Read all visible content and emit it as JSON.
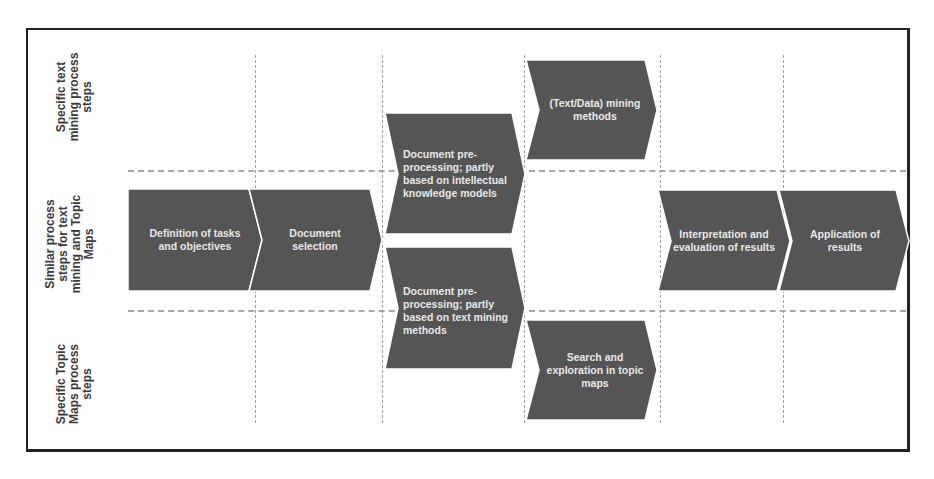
{
  "lanes": [
    {
      "id": "text-mining",
      "label": "Specific text mining process steps"
    },
    {
      "id": "similar",
      "label": "Similar process steps for text mining and Topic Maps"
    },
    {
      "id": "topic-maps",
      "label": "Specific Topic Maps process steps"
    }
  ],
  "steps": {
    "definition": "Definition of tasks and objectives",
    "selection": "Document selection",
    "preproc_knowledge": "Document pre-processing; partly based on intellectual knowledge models",
    "preproc_textmining": "Document pre-processing; partly based on text mining methods",
    "mining_methods": "(Text/Data) mining methods",
    "search_exploration": "Search and exploration in topic maps",
    "interpretation": "Interpretation and evaluation of results",
    "application": "Application of results"
  },
  "colors": {
    "shape_fill": "#555555",
    "dashed_line": "#a8a8a8",
    "frame": "#222222",
    "label_text": "#3a3a3a",
    "shape_text": "#e8e8e8"
  }
}
